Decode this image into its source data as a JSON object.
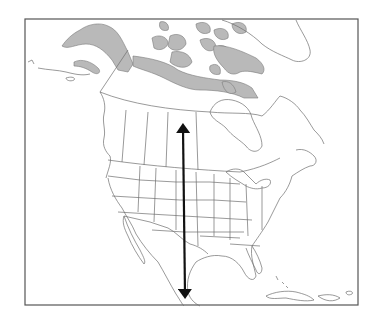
{
  "map": {
    "subject": "North America outline map",
    "labels": [],
    "colors": {
      "background": "#ffffff",
      "frame": "#555555",
      "outline": "#6e6e6e",
      "shaded_region": "#b9b9b9",
      "arrow": "#111111"
    },
    "frame": {
      "x": 25,
      "y": 19,
      "width": 333,
      "height": 286
    },
    "shaded_regions": [
      "Alaska north slope / Brooks Range",
      "Canadian Arctic coast",
      "Canadian Arctic Archipelago"
    ],
    "arrow": {
      "type": "double-headed",
      "orientation": "vertical",
      "x": 183,
      "y_start": 120,
      "y_end": 302,
      "description": "North-south line through central North America"
    }
  }
}
